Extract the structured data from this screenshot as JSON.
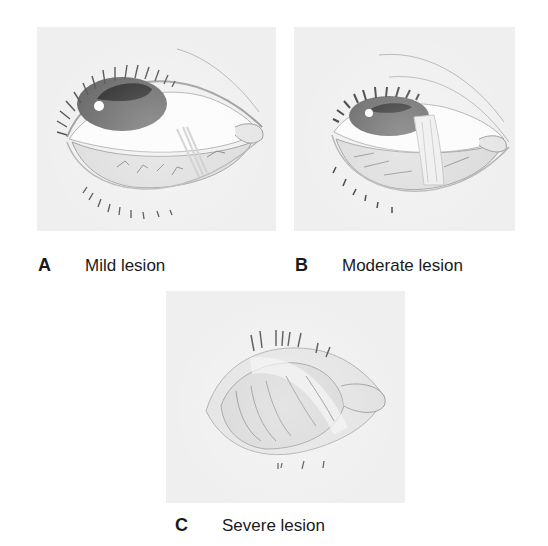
{
  "figure": {
    "panels": [
      {
        "id": "A",
        "letter": "A",
        "caption": "Mild lesion",
        "severity": "mild"
      },
      {
        "id": "B",
        "letter": "B",
        "caption": "Moderate lesion",
        "severity": "moderate"
      },
      {
        "id": "C",
        "letter": "C",
        "caption": "Severe lesion",
        "severity": "severe"
      }
    ],
    "colors": {
      "panel_background": "#efefef",
      "line": "#555555",
      "iris": "#5a5a5a",
      "pupil": "#1c1c1c",
      "caption_text": "#1a1a1a"
    }
  }
}
